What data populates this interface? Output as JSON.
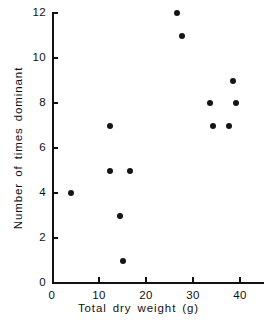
{
  "chart_data": {
    "type": "scatter",
    "title": "",
    "xlabel": "Total dry weight (g)",
    "ylabel": "Number of times dominant",
    "xlim": [
      0,
      40
    ],
    "ylim": [
      0,
      12
    ],
    "grid": false,
    "legend": null,
    "x_ticks": [
      {
        "value": 0,
        "label": "0"
      },
      {
        "value": 10,
        "label": "10"
      },
      {
        "value": 20,
        "label": "20"
      },
      {
        "value": 30,
        "label": "30"
      },
      {
        "value": 40,
        "label": "40"
      }
    ],
    "y_ticks": [
      {
        "value": 0,
        "label": "0"
      },
      {
        "value": 2,
        "label": "2"
      },
      {
        "value": 4,
        "label": "4"
      },
      {
        "value": 6,
        "label": "6"
      },
      {
        "value": 8,
        "label": "8"
      },
      {
        "value": 10,
        "label": "10"
      },
      {
        "value": 12,
        "label": "12"
      }
    ],
    "marker": {
      "shape": "circle",
      "color": "#151515",
      "size": 6
    },
    "points": [
      {
        "x": 4.0,
        "y": 4
      },
      {
        "x": 12.4,
        "y": 7
      },
      {
        "x": 12.4,
        "y": 5
      },
      {
        "x": 14.5,
        "y": 3
      },
      {
        "x": 15.1,
        "y": 1
      },
      {
        "x": 16.6,
        "y": 5
      },
      {
        "x": 26.6,
        "y": 12
      },
      {
        "x": 27.7,
        "y": 11
      },
      {
        "x": 33.6,
        "y": 8
      },
      {
        "x": 34.2,
        "y": 7
      },
      {
        "x": 37.7,
        "y": 7
      },
      {
        "x": 38.6,
        "y": 9
      },
      {
        "x": 39.1,
        "y": 8
      }
    ]
  },
  "axes": {
    "x_title": "Total dry weight (g)",
    "y_title": "Number of times dominant"
  }
}
